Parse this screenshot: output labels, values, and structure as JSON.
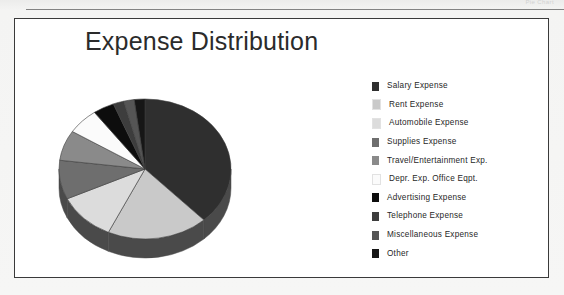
{
  "page": {
    "top_caption": "Pie Chart"
  },
  "chart": {
    "title": "Expense Distribution"
  },
  "chart_data": {
    "type": "pie",
    "title": "Expense Distribution",
    "xlabel": "",
    "ylabel": "",
    "legend_position": "right",
    "three_d": true,
    "categories": [
      "Salary Expense",
      "Rent Expense",
      "Automobile Expense",
      "Supplies Expense",
      "Travel/Entertainment Exp.",
      "Depr. Exp. Office Eqpt.",
      "Advertising Expense",
      "Telephone Expense",
      "Miscellaneous Expense",
      "Other"
    ],
    "values": [
      38,
      19,
      11,
      9,
      7,
      6,
      4,
      2,
      2,
      2
    ],
    "colors": [
      "#2f2f2f",
      "#c9c9c9",
      "#dcdcdc",
      "#6e6e6e",
      "#8a8a8a",
      "#fbfbfb",
      "#0d0d0d",
      "#3d3d3d",
      "#555555",
      "#161616"
    ],
    "rim_color": "#4a4a4a"
  },
  "legend": {
    "items": [
      {
        "label": "Salary Expense",
        "color": "#2f2f2f"
      },
      {
        "label": "Rent Expense",
        "color": "#c9c9c9"
      },
      {
        "label": "Automobile Expense",
        "color": "#dcdcdc"
      },
      {
        "label": "Supplies Expense",
        "color": "#6e6e6e"
      },
      {
        "label": "Travel/Entertainment Exp.",
        "color": "#8a8a8a"
      },
      {
        "label": "Depr. Exp. Office Eqpt.",
        "color": "#fbfbfb"
      },
      {
        "label": "Advertising Expense",
        "color": "#0d0d0d"
      },
      {
        "label": "Telephone Expense",
        "color": "#3d3d3d"
      },
      {
        "label": "Miscellaneous Expense",
        "color": "#555555"
      },
      {
        "label": "Other",
        "color": "#161616"
      }
    ]
  }
}
